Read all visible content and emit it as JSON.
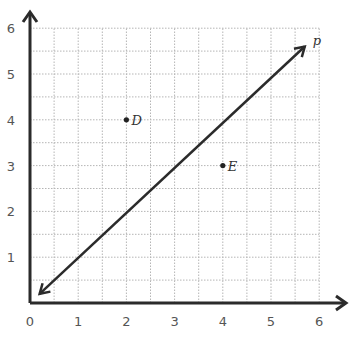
{
  "chart_data": {
    "type": "scatter",
    "title": "",
    "xlabel": "",
    "ylabel": "",
    "xlim": [
      0,
      6
    ],
    "ylim": [
      0,
      6
    ],
    "grid": true,
    "grid_minor_step": 0.5,
    "x_ticks": [
      "0",
      "1",
      "2",
      "3",
      "4",
      "5",
      "6"
    ],
    "y_ticks": [
      "1",
      "2",
      "3",
      "4",
      "5",
      "6"
    ],
    "points": [
      {
        "label": "D",
        "x": 2,
        "y": 4
      },
      {
        "label": "E",
        "x": 4,
        "y": 3
      }
    ],
    "lines": [
      {
        "label": "p",
        "type": "line-with-arrows",
        "from": [
          0.2,
          0.2
        ],
        "to": [
          5.7,
          5.6
        ],
        "equation": "y = x"
      }
    ]
  },
  "colors": {
    "axis": "#2b2b2b",
    "grid": "#b5b5b5",
    "line": "#2b2b2b",
    "tick_text": "#555555"
  }
}
